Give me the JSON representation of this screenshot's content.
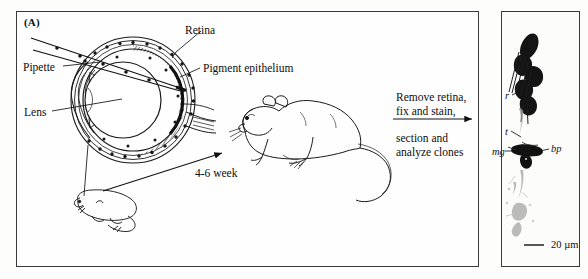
{
  "figure": {
    "panel_a": {
      "letter": "(A)",
      "labels": {
        "pipette": "Pipette",
        "lens": "Lens",
        "retina": "Retina",
        "pigment_epithelium": "Pigment epithelium",
        "time_interval": "4-6 week"
      },
      "process_text": {
        "above_arrow_line1": "Remove retina,",
        "above_arrow_line2": "fix and stain,",
        "below_arrow_line1": "section and",
        "below_arrow_line2": "analyze clones"
      },
      "icons": {
        "eye_cross_section": "eye-cross-section-icon",
        "pipette_needle": "pipette-needle-icon",
        "newborn_rat": "newborn-rat-icon",
        "adult_rat": "adult-rat-icon",
        "time_arrow": "arrow-right-icon",
        "process_arrow": "arrow-right-icon"
      }
    },
    "panel_b": {
      "letter": "(B)",
      "micrograph_labels": {
        "rods": "r",
        "bipolar_terminal": "t",
        "mueller_glia": "mg",
        "bipolar_cell": "bp"
      },
      "scale_bar": {
        "dash": "—",
        "value": "20",
        "unit": "µm",
        "text": "—  20 µm"
      },
      "icons": {
        "micrograph": "micrograph-stained-clone-icon",
        "scale_bar": "scale-bar-icon"
      }
    },
    "colors": {
      "frame": "#3a3a3a",
      "ink": "#111111",
      "background": "#fefefe",
      "stain_dark": "#1a1a1a",
      "stain_faint": "#b9b9b9"
    }
  }
}
